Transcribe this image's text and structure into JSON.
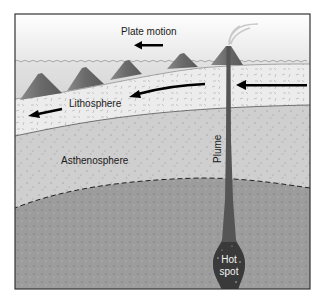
{
  "figure": {
    "type": "hotspot-cross-section",
    "labels": {
      "plate_motion": "Plate motion",
      "lithosphere": "Lithosphere",
      "asthenosphere": "Asthenosphere",
      "plume": "Plume",
      "hot_spot_line1": "Hot",
      "hot_spot_line2": "spot"
    },
    "volcanoes": [
      {
        "name": "oldest-volcano",
        "active": false
      },
      {
        "name": "older-volcano",
        "active": false
      },
      {
        "name": "old-volcano",
        "active": false
      },
      {
        "name": "young-volcano",
        "active": false
      },
      {
        "name": "active-volcano",
        "active": true
      }
    ],
    "arrows": [
      {
        "name": "plate-motion-arrow",
        "direction": "left"
      },
      {
        "name": "lithosphere-motion-arrow-right",
        "direction": "left"
      },
      {
        "name": "lithosphere-motion-arrow-middle",
        "direction": "left"
      },
      {
        "name": "lithosphere-motion-arrow-left",
        "direction": "left"
      }
    ],
    "colors": {
      "sky": "#f4f4f4",
      "sea": "#dcdcdc",
      "lithosphere": "#e8e8e8",
      "asthenosphere": "#cdcdcd",
      "deep_mantle": "#9a9a9a",
      "plume": "#555555",
      "hot_spot": "#3d3d3d",
      "volcano": "#6e6e6e",
      "frame": "#333333"
    }
  }
}
